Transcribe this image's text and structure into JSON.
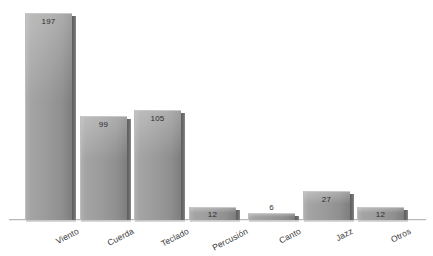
{
  "chart_data": {
    "type": "bar",
    "title": "",
    "subtitle": "",
    "xlabel": "",
    "ylabel": "",
    "grid": false,
    "legend": false,
    "legend_position": "none",
    "axis_visible": {
      "x": true,
      "y": false
    },
    "ylim": [
      0,
      210
    ],
    "categories": [
      "Viento",
      "Cuerda",
      "Teclado",
      "Percusión",
      "Canto",
      "Jazz",
      "Otros"
    ],
    "values": [
      197,
      99,
      105,
      12,
      6,
      27,
      12
    ],
    "value_labels": [
      "197",
      "99",
      "105",
      "12",
      "6",
      "27",
      "12"
    ],
    "label_placement": [
      "inside",
      "inside",
      "inside",
      "inside",
      "outside",
      "inside",
      "inside"
    ],
    "series": [
      {
        "name": "",
        "values": [
          197,
          99,
          105,
          12,
          6,
          27,
          12
        ]
      }
    ],
    "colors": {
      "bar_light": "#b0b0b0",
      "bar_mid": "#9b9b9b",
      "bar_dark": "#7e7e7e",
      "bar_side": "#5e5e5e",
      "axis": "#b9b9b9",
      "value_text": "#2c2c2c",
      "label_text": "#3a3a3a",
      "background": "#ffffff"
    }
  },
  "bars": [
    {
      "category": "Viento",
      "value_label": "197",
      "left": 25,
      "width": 47,
      "height": 207,
      "value_top": 4,
      "label_placement": "inside",
      "label_x": 76,
      "label_y": 226
    },
    {
      "category": "Cuerda",
      "value_label": "99",
      "left": 80,
      "width": 47,
      "height": 104,
      "value_top": 4,
      "label_placement": "inside",
      "label_x": 131,
      "label_y": 226
    },
    {
      "category": "Teclado",
      "value_label": "105",
      "left": 134,
      "width": 47,
      "height": 110,
      "value_top": 4,
      "label_placement": "inside",
      "label_x": 186,
      "label_y": 226
    },
    {
      "category": "Percusión",
      "value_label": "12",
      "left": 189,
      "width": 47,
      "height": 13,
      "value_top": 3,
      "label_placement": "inside",
      "label_x": 245,
      "label_y": 226
    },
    {
      "category": "Canto",
      "value_label": "6",
      "left": 248,
      "width": 47,
      "height": 7,
      "value_top": -10,
      "label_placement": "outside",
      "label_x": 298,
      "label_y": 226
    },
    {
      "category": "Jazz",
      "value_label": "27",
      "left": 303,
      "width": 47,
      "height": 29,
      "value_top": 4,
      "label_placement": "inside",
      "label_x": 350,
      "label_y": 226
    },
    {
      "category": "Otros",
      "value_label": "12",
      "left": 357,
      "width": 47,
      "height": 13,
      "value_top": 3,
      "label_placement": "inside",
      "label_x": 408,
      "label_y": 226
    }
  ],
  "axis": {
    "baseline_bottom": 36
  }
}
